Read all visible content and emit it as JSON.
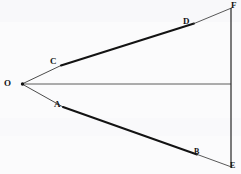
{
  "figure": {
    "type": "geometric-diagram",
    "background_color": "#fbfbfc",
    "ink_color": "#131313",
    "canvas": {
      "width": 241,
      "height": 174
    },
    "points": [
      {
        "id": "O",
        "label": "O",
        "x": 22,
        "y": 84,
        "label_x": 4,
        "label_y": 80
      },
      {
        "id": "C",
        "label": "C",
        "x": 62,
        "y": 65,
        "label_x": 50,
        "label_y": 58
      },
      {
        "id": "D",
        "label": "D",
        "x": 193,
        "y": 24,
        "label_x": 183,
        "label_y": 18
      },
      {
        "id": "F",
        "label": "F",
        "x": 231,
        "y": 8,
        "label_x": 231,
        "label_y": 1
      },
      {
        "id": "A",
        "label": "A",
        "x": 63,
        "y": 107,
        "label_x": 54,
        "label_y": 101
      },
      {
        "id": "B",
        "label": "B",
        "x": 196,
        "y": 154,
        "label_x": 194,
        "label_y": 148
      },
      {
        "id": "E",
        "label": "E",
        "x": 231,
        "y": 167,
        "label_x": 230,
        "label_y": 162
      }
    ],
    "segments": [
      {
        "id": "O-C",
        "from": "O",
        "to": "C",
        "weight": "thin",
        "stroke_width": 0.85
      },
      {
        "id": "C-D",
        "from": "C",
        "to": "D",
        "weight": "thick",
        "stroke_width": 2.1
      },
      {
        "id": "D-F",
        "from": "D",
        "to": "F",
        "weight": "thin",
        "stroke_width": 0.85
      },
      {
        "id": "O-A",
        "from": "O",
        "to": "A",
        "weight": "thin",
        "stroke_width": 0.85
      },
      {
        "id": "A-B",
        "from": "A",
        "to": "B",
        "weight": "thick",
        "stroke_width": 2.0
      },
      {
        "id": "B-E",
        "from": "B",
        "to": "E",
        "weight": "thin",
        "stroke_width": 0.85
      },
      {
        "id": "O-axis",
        "from": "O",
        "to": "axis-end",
        "weight": "thin",
        "stroke_width": 0.9
      },
      {
        "id": "F-E",
        "from": "F",
        "to": "E",
        "weight": "medium",
        "stroke_width": 1.3
      }
    ],
    "axis": {
      "id": "horizontal-axis",
      "x1": 22,
      "y1": 84,
      "x2": 231,
      "y2": 84
    }
  }
}
